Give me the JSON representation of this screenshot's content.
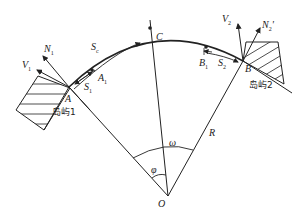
{
  "diagram": {
    "type": "geometry-physics",
    "points": {
      "A": {
        "label": "A"
      },
      "B": {
        "label": "B"
      },
      "C": {
        "label": "C"
      },
      "O": {
        "label": "O"
      },
      "A1": {
        "label": "A",
        "sub": "1"
      },
      "B1": {
        "label": "B",
        "sub": "1"
      }
    },
    "segments": {
      "S1": {
        "label": "S",
        "sub": "1"
      },
      "S2": {
        "label": "S",
        "sub": "2"
      },
      "Sc": {
        "label": "S",
        "sub": "c"
      }
    },
    "vectors": {
      "N1": {
        "label": "N",
        "sub": "1"
      },
      "V1": {
        "label": "V",
        "sub": "1"
      },
      "V2": {
        "label": "V",
        "sub": "2"
      },
      "N2p": {
        "label": "N",
        "sub": "2",
        "sup": "'"
      }
    },
    "radius_label": "R",
    "angles": {
      "phi": "φ",
      "omega": "ω"
    },
    "islands": {
      "island1": "岛屿1",
      "island2": "岛屿2"
    },
    "colors": {
      "stroke": "#222222",
      "background": "#ffffff"
    }
  }
}
